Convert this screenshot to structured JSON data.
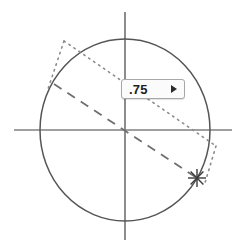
{
  "widget": {
    "name": "angle-value-control",
    "colors": {
      "axis": "#808080",
      "circle": "#555555",
      "dashed_line": "#6f6f6f",
      "dotted_line": "#8c8c8c",
      "marker": "#3a3a3a",
      "field_border": "#a8a8a8",
      "field_background": "#fbfbfb",
      "field_text": "#1d1d1d",
      "background": "#ffffff"
    },
    "geometry": {
      "center_x": 125,
      "center_y": 130,
      "radius_x": 85,
      "radius_y": 91,
      "axis_h_x1": 14,
      "axis_h_x2": 232,
      "axis_h_y": 130,
      "axis_v_y1": 12,
      "axis_v_y2": 240,
      "axis_v_x": 125,
      "dashed_x1": 54,
      "dashed_y1": 84,
      "dashed_x2": 197,
      "dashed_y2": 178,
      "dotted_x1": 64,
      "dotted_y1": 41,
      "dotted_x2": 216,
      "dotted_y2": 146,
      "tangent_x1": 64,
      "tangent_y1": 41,
      "tangent_x2": 48,
      "tangent_y2": 89,
      "tangent2_x1": 216,
      "tangent2_y1": 146,
      "tangent2_x2": 205,
      "tangent2_y2": 184,
      "marker_x": 197,
      "marker_y": 178,
      "marker_size": 9
    }
  },
  "value_field": {
    "label": "angle-value",
    "value": ".75",
    "placeholder": "0",
    "stepper_icon": "triangle-right-icon",
    "left": 121,
    "top": 79,
    "width": 64,
    "height": 20
  }
}
